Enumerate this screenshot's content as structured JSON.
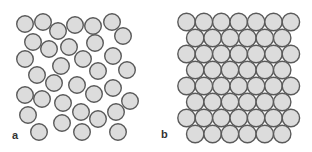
{
  "figure": {
    "style": {
      "fill": "#dcdcdc",
      "stroke": "#5a5a5a",
      "stroke_width": 1.4,
      "background": "#ffffff"
    },
    "panels": [
      {
        "id": "a",
        "label": "a",
        "description": "disordered (random) arrangement of circles",
        "radius": 8.3,
        "circles": [
          [
            25,
            24
          ],
          [
            43,
            22
          ],
          [
            58,
            31
          ],
          [
            75,
            25
          ],
          [
            93,
            26
          ],
          [
            112,
            22
          ],
          [
            123,
            36
          ],
          [
            33,
            42
          ],
          [
            49,
            49
          ],
          [
            69,
            47
          ],
          [
            95,
            43
          ],
          [
            25,
            59
          ],
          [
            61,
            66
          ],
          [
            83,
            59
          ],
          [
            113,
            56
          ],
          [
            37,
            75
          ],
          [
            98,
            71
          ],
          [
            127,
            70
          ],
          [
            54,
            83
          ],
          [
            77,
            85
          ],
          [
            113,
            88
          ],
          [
            25,
            95
          ],
          [
            42,
            99
          ],
          [
            63,
            103
          ],
          [
            94,
            94
          ],
          [
            130,
            101
          ],
          [
            28,
            115
          ],
          [
            81,
            112
          ],
          [
            116,
            112
          ],
          [
            62,
            123
          ],
          [
            98,
            119
          ],
          [
            39,
            132
          ],
          [
            82,
            132
          ],
          [
            118,
            132
          ]
        ]
      },
      {
        "id": "b",
        "label": "b",
        "description": "ordered close-packed hexagonal arrangement of circles",
        "radius": 8.7,
        "rows": [
          {
            "y": 22,
            "x_start": 186.5,
            "count": 7
          },
          {
            "y": 38,
            "x_start": 195.2,
            "count": 6
          },
          {
            "y": 54,
            "x_start": 186.5,
            "count": 7
          },
          {
            "y": 70,
            "x_start": 195.2,
            "count": 6
          },
          {
            "y": 86,
            "x_start": 186.5,
            "count": 7
          },
          {
            "y": 102,
            "x_start": 195.2,
            "count": 6
          },
          {
            "y": 118,
            "x_start": 186.5,
            "count": 7
          },
          {
            "y": 134,
            "x_start": 195.2,
            "count": 6
          }
        ],
        "x_step": 17.4
      }
    ]
  }
}
